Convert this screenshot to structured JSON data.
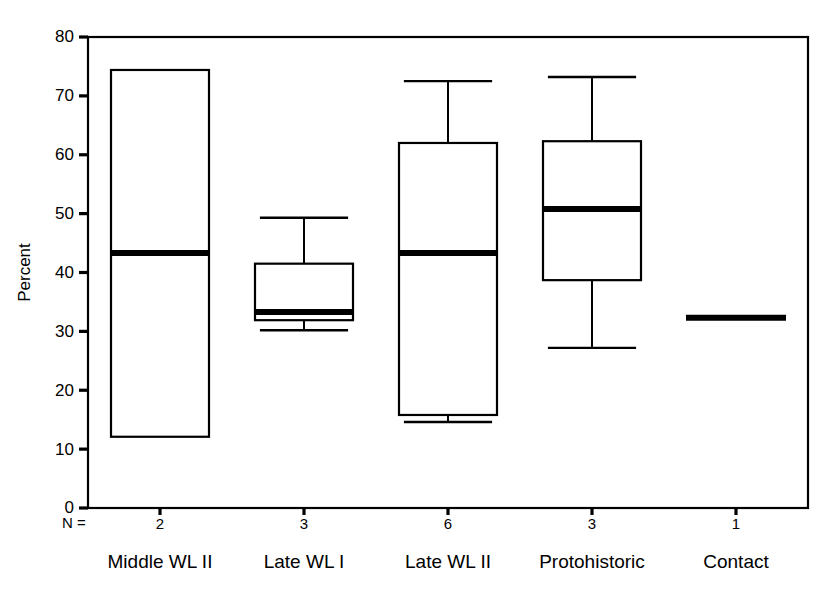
{
  "chart_data": {
    "type": "box",
    "title": "",
    "xlabel": "",
    "ylabel": "Percent",
    "ylim": [
      0,
      80
    ],
    "yticks": [
      0,
      10,
      20,
      30,
      40,
      50,
      60,
      70,
      80
    ],
    "ytick_labels": [
      "0",
      "10",
      "20",
      "30",
      "40",
      "50",
      "60",
      "70",
      "80"
    ],
    "grid": false,
    "legend": null,
    "n_prefix_label": "N =",
    "categories": [
      "Middle WL II",
      "Late WL I",
      "Late WL II",
      "Protohistoric",
      "Contact"
    ],
    "n_values": [
      "2",
      "3",
      "6",
      "3",
      "1"
    ],
    "boxes": [
      {
        "category": "Middle WL II",
        "n": 2,
        "whisker_low": 12.1,
        "q1": 12.1,
        "median": 43.3,
        "q3": 74.4,
        "whisker_high": 74.4,
        "has_whiskers": false
      },
      {
        "category": "Late WL I",
        "n": 3,
        "whisker_low": 30.2,
        "q1": 31.9,
        "median": 33.3,
        "q3": 41.5,
        "whisker_high": 49.3,
        "has_whiskers": true
      },
      {
        "category": "Late WL II",
        "n": 6,
        "whisker_low": 14.6,
        "q1": 15.8,
        "median": 43.3,
        "q3": 62.0,
        "whisker_high": 72.5,
        "has_whiskers": true
      },
      {
        "category": "Protohistoric",
        "n": 3,
        "whisker_low": 27.2,
        "q1": 38.7,
        "median": 50.8,
        "q3": 62.3,
        "whisker_high": 73.2,
        "has_whiskers": true
      },
      {
        "category": "Contact",
        "n": 1,
        "whisker_low": 32.3,
        "q1": 32.3,
        "median": 32.3,
        "q3": 32.3,
        "whisker_high": 32.3,
        "has_whiskers": false
      }
    ]
  }
}
